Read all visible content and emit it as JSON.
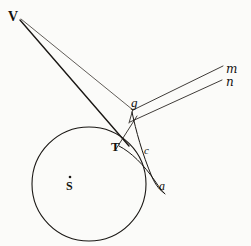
{
  "figure": {
    "background_color": "#fbfbf9",
    "ink_color": "#1a1714",
    "labels": [
      {
        "id": "V",
        "text": "V",
        "x": 8,
        "y": 10,
        "size": 13,
        "style": "roman",
        "role": "apex-point"
      },
      {
        "id": "g",
        "text": "g",
        "x": 131,
        "y": 97,
        "size": 12,
        "style": "italic",
        "role": "curve-point"
      },
      {
        "id": "T",
        "text": "T",
        "x": 111,
        "y": 140,
        "size": 13,
        "style": "roman",
        "role": "tangent-point"
      },
      {
        "id": "c",
        "text": "c",
        "x": 144,
        "y": 146,
        "size": 11,
        "style": "italic",
        "role": "curve-point"
      },
      {
        "id": "a",
        "text": "a",
        "x": 159,
        "y": 179,
        "size": 11,
        "style": "italic",
        "role": "curve-point"
      },
      {
        "id": "S",
        "text": "S",
        "x": 66,
        "y": 180,
        "size": 12,
        "style": "roman",
        "role": "circle-center"
      },
      {
        "id": "m",
        "text": "m",
        "x": 226,
        "y": 64,
        "size": 11,
        "style": "script",
        "role": "ray-endpoint-upper"
      },
      {
        "id": "n",
        "text": "n",
        "x": 226,
        "y": 77,
        "size": 11,
        "style": "script",
        "role": "ray-endpoint-lower"
      }
    ],
    "circle": {
      "center_x": 89,
      "center_y": 184,
      "radius": 57,
      "stroke": "#1a1714",
      "stroke_width": 1.1
    },
    "center_dot": {
      "x": 70,
      "y": 177,
      "r": 1.3
    },
    "lines": [
      {
        "id": "V-to-T",
        "x1": 20,
        "y1": 20,
        "x2": 128,
        "y2": 145,
        "stroke_width": 1.3
      },
      {
        "id": "V-to-g",
        "x1": 21,
        "y1": 19,
        "x2": 133,
        "y2": 110,
        "stroke_width": 0.8
      },
      {
        "id": "g-to-m",
        "x1": 134,
        "y1": 110,
        "x2": 224,
        "y2": 66,
        "stroke_width": 0.9
      },
      {
        "id": "junction-to-n",
        "x1": 131,
        "y1": 121,
        "x2": 223,
        "y2": 80,
        "stroke_width": 0.9
      },
      {
        "id": "g-junction-short",
        "x1": 133,
        "y1": 108,
        "x2": 130,
        "y2": 122,
        "stroke_width": 0.9
      },
      {
        "id": "T-to-junction",
        "x1": 117,
        "y1": 148,
        "x2": 136,
        "y2": 118,
        "stroke_width": 0.9
      }
    ],
    "curves": [
      {
        "id": "trajectory-g-c-a",
        "d": "M 132 112 C 136 130, 141 152, 152 177 C 156 186, 160 190, 164 193",
        "stroke_width": 1.0
      },
      {
        "id": "trajectory-inner-T-c-a",
        "d": "M 120 146 C 132 152, 144 164, 155 181 C 159 187, 162 191, 165 194",
        "stroke_width": 1.0
      }
    ]
  }
}
